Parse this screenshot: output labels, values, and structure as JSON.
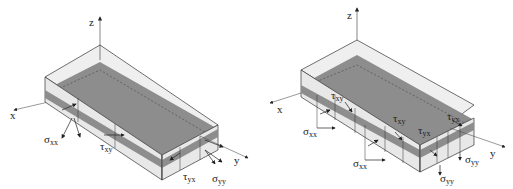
{
  "figure": {
    "panels": [
      {
        "id": "left",
        "axes": {
          "x": "x",
          "y": "y",
          "z": "z"
        },
        "labels": {
          "sigma_xx": {
            "sym": "σ",
            "sub": "xx"
          },
          "tau_xy": {
            "sym": "τ",
            "sub": "xy"
          },
          "tau_yx": {
            "sym": "τ",
            "sub": "yx"
          },
          "sigma_yy": {
            "sym": "σ",
            "sub": "yy"
          }
        }
      },
      {
        "id": "right",
        "axes": {
          "x": "x",
          "y": "y",
          "z": "z"
        },
        "labels": {
          "tau_xy_1": {
            "sym": "τ",
            "sub": "xy"
          },
          "sigma_xx_1": {
            "sym": "σ",
            "sub": "xx"
          },
          "tau_xy_2": {
            "sym": "τ",
            "sub": "xy"
          },
          "tau_yx_1": {
            "sym": "τ",
            "sub": "yx"
          },
          "tau_yx_2": {
            "sym": "τ",
            "sub": "yx"
          },
          "sigma_xx_2": {
            "sym": "σ",
            "sub": "xx"
          },
          "sigma_yy_1": {
            "sym": "σ",
            "sub": "yy"
          },
          "sigma_yy_2": {
            "sym": "σ",
            "sub": "yy"
          }
        }
      }
    ],
    "colors": {
      "shell": "#ececec",
      "core_top": "#8c8c8c",
      "core_side": "#9a9a9a",
      "edge": "#333333"
    }
  }
}
